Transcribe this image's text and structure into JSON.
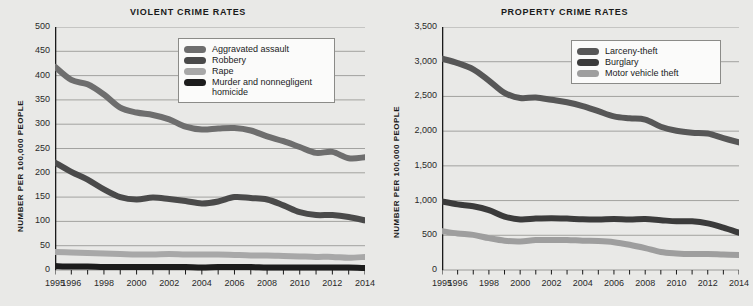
{
  "page": {
    "background_color": "#e9e9e7",
    "panel_background_color": "#eaeae8",
    "grid_color": "#9a9a97",
    "axis_color": "#1a1a1a",
    "legend_background": "#fbfbfa",
    "legend_border": "#8b8b88"
  },
  "chart_data": [
    {
      "type": "line",
      "id": "violent-crime-rates",
      "title": "VIOLENT CRIME RATES",
      "xlabel": "",
      "ylabel": "NUMBER PER 100,000 PEOPLE",
      "xlim": [
        1995,
        2014
      ],
      "ylim": [
        0,
        500
      ],
      "ytick_values": [
        0,
        50,
        100,
        150,
        200,
        250,
        300,
        350,
        400,
        450,
        500
      ],
      "ytick_labels": [
        "0",
        "50",
        "100",
        "150",
        "200",
        "250",
        "300",
        "350",
        "400",
        "450",
        "500"
      ],
      "x": [
        1995,
        1996,
        1997,
        1998,
        1999,
        2000,
        2001,
        2002,
        2003,
        2004,
        2005,
        2006,
        2007,
        2008,
        2009,
        2010,
        2011,
        2012,
        2013,
        2014
      ],
      "xtick_values": [
        1995,
        1996,
        1998,
        2000,
        2002,
        2004,
        2006,
        2008,
        2010,
        2012,
        2014
      ],
      "xtick_labels": [
        "1995",
        "1996",
        "1998",
        "2000",
        "2002",
        "2004",
        "2006",
        "2008",
        "2010",
        "2012",
        "2014"
      ],
      "grid": "horizontal",
      "legend_position": "top-right-inside",
      "series": [
        {
          "name": "Aggravated assault",
          "color": "#6e6e6e",
          "values": [
            418,
            391,
            382,
            361,
            334,
            324,
            319,
            310,
            295,
            289,
            291,
            292,
            287,
            275,
            265,
            253,
            241,
            243,
            230,
            232
          ]
        },
        {
          "name": "Robbery",
          "color": "#4a4a4a",
          "values": [
            221,
            202,
            186,
            166,
            150,
            145,
            149,
            146,
            142,
            137,
            141,
            150,
            148,
            145,
            133,
            119,
            113,
            113,
            109,
            102
          ]
        },
        {
          "name": "Rape",
          "color": "#a8a8a8",
          "values": [
            37,
            36,
            35,
            34,
            33,
            32,
            32,
            33,
            32,
            32,
            32,
            31,
            30,
            30,
            29,
            28,
            27,
            27,
            25,
            27
          ]
        },
        {
          "name": "Murder and nonnegligent homicide",
          "color": "#1c1c1c",
          "values": [
            8,
            7,
            7,
            6,
            6,
            6,
            6,
            6,
            6,
            5,
            6,
            6,
            6,
            5,
            5,
            5,
            5,
            5,
            5,
            4
          ]
        }
      ]
    },
    {
      "type": "line",
      "id": "property-crime-rates",
      "title": "PROPERTY CRIME RATES",
      "xlabel": "",
      "ylabel": "NUMBER PER 100,000 PEOPLE",
      "xlim": [
        1995,
        2014
      ],
      "ylim": [
        0,
        3500
      ],
      "ytick_values": [
        0,
        500,
        1000,
        1500,
        2000,
        2500,
        3000,
        3500
      ],
      "ytick_labels": [
        "0",
        "500",
        "1,000",
        "1,500",
        "2,000",
        "2,500",
        "3,000",
        "3,500"
      ],
      "x": [
        1995,
        1996,
        1997,
        1998,
        1999,
        2000,
        2001,
        2002,
        2003,
        2004,
        2005,
        2006,
        2007,
        2008,
        2009,
        2010,
        2011,
        2012,
        2013,
        2014
      ],
      "xtick_values": [
        1995,
        1996,
        1998,
        2000,
        2002,
        2004,
        2006,
        2008,
        2010,
        2012,
        2014
      ],
      "xtick_labels": [
        "1995",
        "1996",
        "1998",
        "2000",
        "2002",
        "2004",
        "2006",
        "2008",
        "2010",
        "2012",
        "2014"
      ],
      "grid": "horizontal",
      "legend_position": "top-right-inside",
      "series": [
        {
          "name": "Larceny-theft",
          "color": "#575757",
          "values": [
            3043,
            2980,
            2891,
            2729,
            2551,
            2477,
            2485,
            2451,
            2416,
            2362,
            2287,
            2213,
            2185,
            2167,
            2064,
            2005,
            1976,
            1965,
            1899,
            1837
          ]
        },
        {
          "name": "Burglary",
          "color": "#3b3b3b",
          "values": [
            987,
            945,
            918,
            863,
            770,
            729,
            741,
            747,
            741,
            730,
            727,
            733,
            726,
            733,
            717,
            701,
            702,
            672,
            610,
            537
          ]
        },
        {
          "name": "Motor vehicle theft",
          "color": "#9e9e9e",
          "values": [
            560,
            526,
            506,
            459,
            422,
            412,
            431,
            432,
            433,
            422,
            417,
            401,
            364,
            315,
            259,
            239,
            230,
            230,
            222,
            216
          ]
        }
      ]
    }
  ]
}
